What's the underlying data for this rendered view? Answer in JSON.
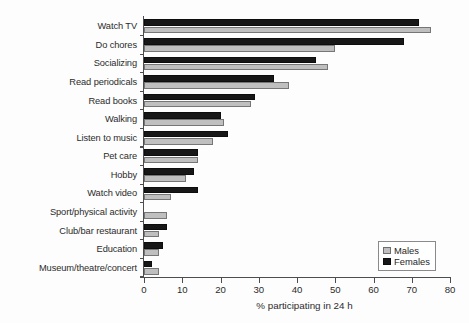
{
  "chart_data": {
    "type": "bar",
    "orientation": "horizontal",
    "title": "",
    "xlabel": "% participating in 24 h",
    "ylabel": "",
    "xlim": [
      0,
      80
    ],
    "xticks": [
      0,
      10,
      20,
      30,
      40,
      50,
      60,
      70,
      80
    ],
    "grid": false,
    "legend_position": "bottom-right",
    "categories": [
      "Watch TV",
      "Do chores",
      "Socializing",
      "Read periodicals",
      "Read books",
      "Walking",
      "Listen to music",
      "Pet care",
      "Hobby",
      "Watch video",
      "Sport/physical activity",
      "Club/bar restaurant",
      "Education",
      "Museum/theatre/concert"
    ],
    "series": [
      {
        "name": "Females",
        "color": "#171717",
        "values": [
          72,
          68,
          45,
          34,
          29,
          20,
          22,
          14,
          13,
          14,
          0,
          6,
          5,
          2
        ]
      },
      {
        "name": "Males",
        "color": "#bfbfbf",
        "values": [
          75,
          50,
          48,
          38,
          28,
          21,
          18,
          14,
          11,
          7,
          6,
          4,
          4,
          4
        ]
      }
    ]
  },
  "legend": {
    "entries": [
      {
        "label": "Males",
        "swatch": "males"
      },
      {
        "label": "Females",
        "swatch": "females"
      }
    ]
  },
  "axis": {
    "x_title": "% participating in 24 h"
  }
}
